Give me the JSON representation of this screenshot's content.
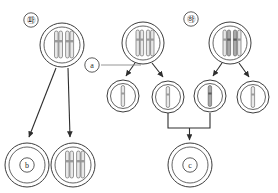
{
  "diagram": {
    "type": "biology-cell-division",
    "panels": [
      {
        "id": "panel-left",
        "label": "㉺",
        "label_x": 31,
        "label_y": 20
      },
      {
        "id": "panel-right",
        "label": "㉻",
        "label_x": 191,
        "label_y": 19
      }
    ],
    "callouts": [
      {
        "id": "callout-a",
        "label": "a",
        "label_x": 92,
        "label_y": 65,
        "leader": {
          "x1": 101,
          "y1": 65,
          "x2": 140,
          "y2": 65
        }
      }
    ],
    "cells": [
      {
        "id": "cell-parent-left",
        "cx": 62,
        "cy": 45,
        "r_outer": 22,
        "r_inner": 18,
        "chromosomes": "two-replicated",
        "label": ""
      },
      {
        "id": "cell-parent-mid",
        "cx": 143,
        "cy": 43,
        "r_outer": 21,
        "r_inner": 17,
        "chromosomes": "two-replicated",
        "label": ""
      },
      {
        "id": "cell-parent-right",
        "cx": 230,
        "cy": 43,
        "r_outer": 21,
        "r_inner": 17,
        "chromosomes": "two-replicated-dark",
        "label": ""
      },
      {
        "id": "cell-daughter-1",
        "cx": 123,
        "cy": 96,
        "r_outer": 16,
        "r_inner": 12.5,
        "chromosomes": "one-single",
        "label": ""
      },
      {
        "id": "cell-daughter-2",
        "cx": 168,
        "cy": 97,
        "r_outer": 16,
        "r_inner": 12.5,
        "chromosomes": "one-single",
        "label": ""
      },
      {
        "id": "cell-daughter-3",
        "cx": 210,
        "cy": 96,
        "r_outer": 16,
        "r_inner": 12.5,
        "chromosomes": "one-single-dark",
        "label": ""
      },
      {
        "id": "cell-daughter-4",
        "cx": 253,
        "cy": 97,
        "r_outer": 16,
        "r_inner": 12.5,
        "chromosomes": "one-single",
        "label": ""
      },
      {
        "id": "cell-b",
        "cx": 27,
        "cy": 165,
        "r_outer": 22,
        "r_inner": 18,
        "chromosomes": "none",
        "label": "b"
      },
      {
        "id": "cell-bottom-left-2",
        "cx": 73,
        "cy": 165,
        "r_outer": 22,
        "r_inner": 18,
        "chromosomes": "two-replicated",
        "label": ""
      },
      {
        "id": "cell-c",
        "cx": 190,
        "cy": 165,
        "r_outer": 22,
        "r_inner": 18,
        "chromosomes": "none",
        "label": "c"
      }
    ],
    "arrows": [
      {
        "id": "arrow-left-to-b",
        "x1": 56,
        "y1": 68,
        "x2": 29,
        "y2": 139
      },
      {
        "id": "arrow-left-to-cell2",
        "x1": 68,
        "y1": 68,
        "x2": 70,
        "y2": 139
      },
      {
        "id": "arrow-mid-to-d1",
        "x1": 135,
        "y1": 63,
        "x2": 126,
        "y2": 77
      },
      {
        "id": "arrow-mid-to-d2",
        "x1": 152,
        "y1": 63,
        "x2": 163,
        "y2": 77
      },
      {
        "id": "arrow-right-to-d3",
        "x1": 222,
        "y1": 63,
        "x2": 213,
        "y2": 77
      },
      {
        "id": "arrow-right-to-d4",
        "x1": 239,
        "y1": 63,
        "x2": 249,
        "y2": 77
      },
      {
        "id": "arrow-bracket-to-c",
        "x1": 190,
        "y1": 128,
        "x2": 190,
        "y2": 141
      }
    ],
    "brackets": [
      {
        "id": "bracket-to-c",
        "left_x": 168,
        "right_x": 210,
        "top_y": 113,
        "bar_y": 128
      }
    ]
  }
}
